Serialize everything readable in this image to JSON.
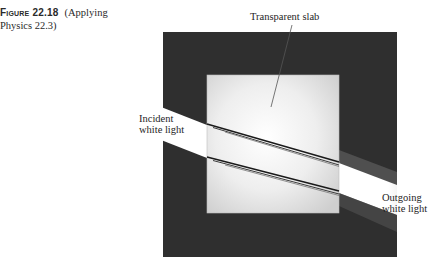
{
  "caption": {
    "figure_label": "Figure 22.18",
    "figure_text": "(Applying Physics 22.3)"
  },
  "labels": {
    "slab": "Transparent slab",
    "incident_line1": "Incident",
    "incident_line2": "white light",
    "outgoing_line1": "Outgoing",
    "outgoing_line2": "white light"
  },
  "colors": {
    "background": "#ffffff",
    "dark_field": "#2f2f2f",
    "slab_center": "#ffffff",
    "slab_edge": "#d4d4d4",
    "beam": "#ffffff",
    "dispersion_line": "#1a1a1a"
  }
}
